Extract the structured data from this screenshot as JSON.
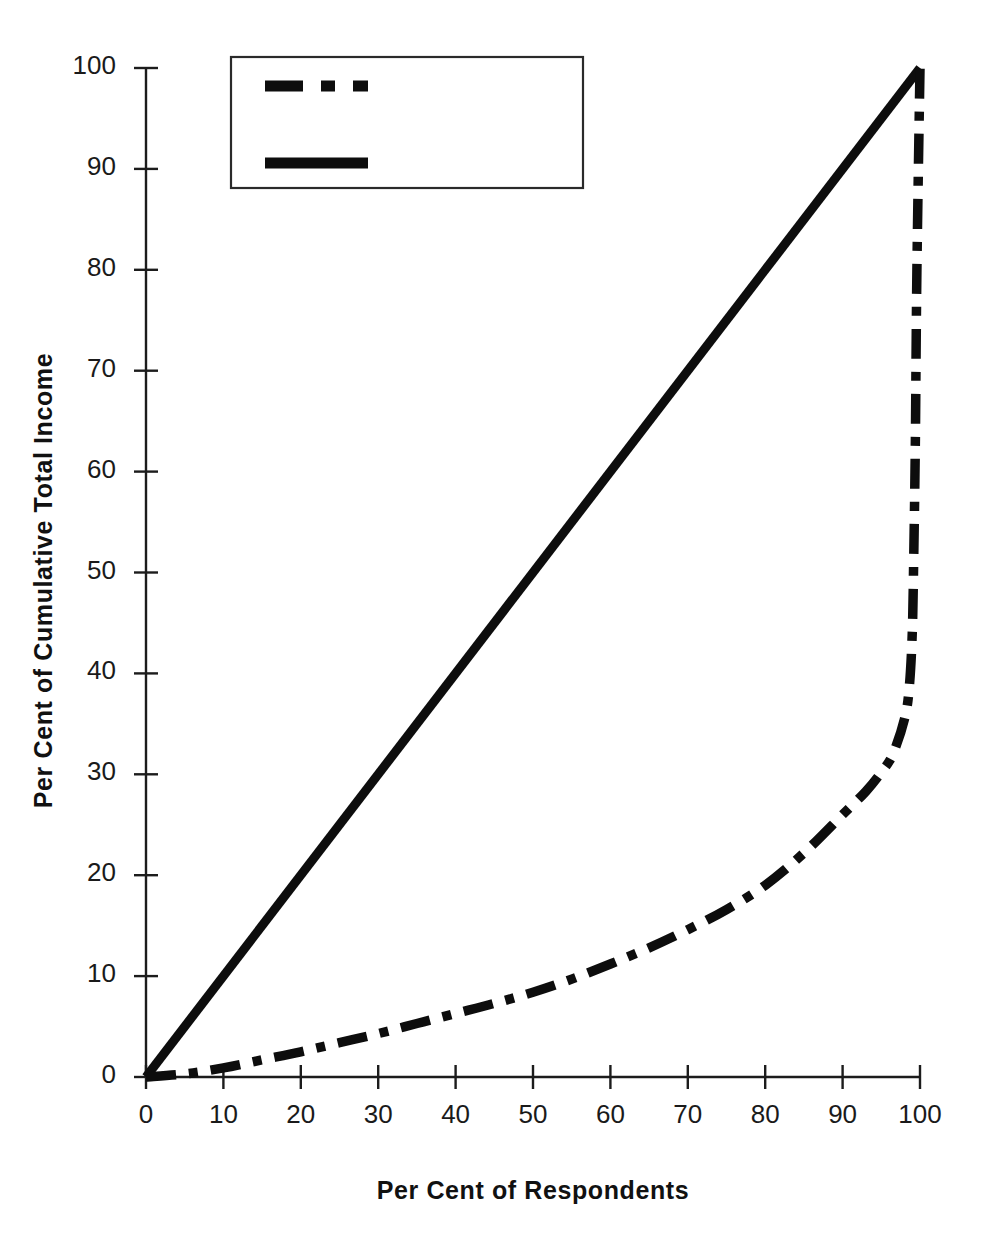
{
  "chart_data": {
    "type": "line",
    "title": "",
    "xlabel": "Per Cent of Respondents",
    "ylabel": "Per Cent of Cumulative Total Income",
    "xlim": [
      0,
      100
    ],
    "ylim": [
      0,
      100
    ],
    "x_ticks": [
      "0",
      "10",
      "20",
      "30",
      "40",
      "50",
      "60",
      "70",
      "80",
      "90",
      "100"
    ],
    "y_ticks": [
      "0",
      "10",
      "20",
      "30",
      "40",
      "50",
      "60",
      "70",
      "80",
      "90",
      "100"
    ],
    "grid": false,
    "legend_position": "upper-left-inside",
    "series": [
      {
        "name": "Lorenz Curve",
        "style": "dash-dot",
        "color": "#0d0d0d",
        "x": [
          0,
          5,
          10,
          15,
          20,
          25,
          30,
          35,
          40,
          45,
          50,
          55,
          60,
          65,
          70,
          75,
          80,
          85,
          90,
          93,
          95,
          96.5,
          98,
          98.6,
          99,
          99.2,
          99.4,
          99.6,
          100
        ],
        "y": [
          0,
          0.3,
          0.9,
          1.7,
          2.5,
          3.4,
          4.3,
          5.3,
          6.3,
          7.3,
          8.4,
          9.7,
          11.2,
          12.8,
          14.6,
          16.6,
          19.0,
          22.2,
          26.0,
          28.3,
          30.2,
          32.0,
          35.5,
          38.5,
          44.0,
          52.0,
          63.0,
          80.0,
          100
        ]
      },
      {
        "name": "Line of Equality",
        "style": "solid",
        "color": "#0d0d0d",
        "x": [
          0,
          100
        ],
        "y": [
          0,
          100
        ]
      }
    ]
  },
  "legend": {
    "entries": [
      {
        "label": "Lorenz Curve",
        "style": "dash-dot"
      },
      {
        "label": "Line of Equality",
        "style": "solid"
      }
    ]
  },
  "axes": {
    "y_title": "Per Cent of Cumulative Total Income",
    "x_title": "Per Cent of Respondents"
  },
  "colors": {
    "line": "#0d0d0d",
    "axis": "#1c1c1c",
    "background": "#ffffff"
  }
}
